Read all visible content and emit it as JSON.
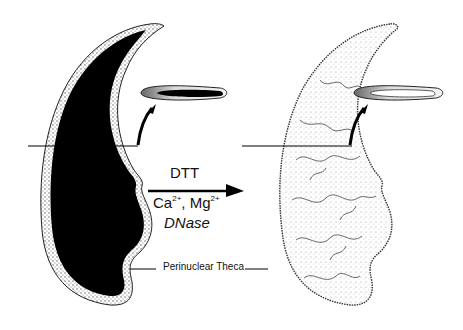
{
  "figure": {
    "type": "schematic diagram of sperm head before and after extraction",
    "left_panel": {
      "name": "intact-sperm-head",
      "nucleus_fill": "#000000",
      "cross_section_inset": "solid nucleus"
    },
    "right_panel": {
      "name": "extracted-sperm-head",
      "nucleus_fill": "textured/stippled",
      "cross_section_inset": "hollow nucleus"
    },
    "treatment": {
      "line1": "DTT",
      "line2_prefix": "Ca",
      "line2_sup1": "2+",
      "line2_mid": ", Mg",
      "line2_sup2": "2+",
      "line3": "DNase"
    },
    "label": "Perinuclear Theca",
    "colors": {
      "ink": "#000000",
      "background": "#ffffff",
      "stipple": "#8a8a8a"
    }
  }
}
